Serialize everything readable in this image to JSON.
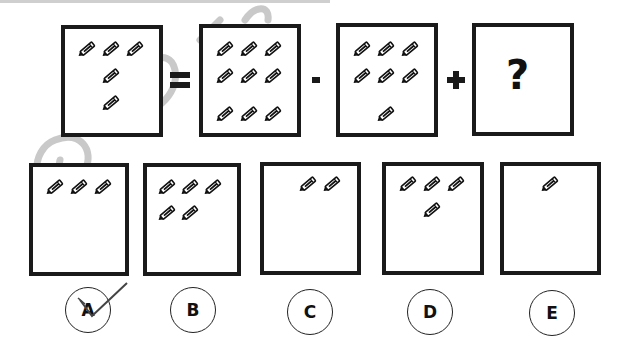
{
  "puzzle": {
    "equation": {
      "operators": [
        "=",
        "-",
        "+"
      ],
      "boxes": [
        {
          "id": "lhs",
          "pencil_count": 5
        },
        {
          "id": "minuend",
          "pencil_count": 9
        },
        {
          "id": "subtrahend",
          "pencil_count": 7
        },
        {
          "id": "unknown",
          "label": "?"
        }
      ]
    },
    "options": [
      {
        "label": "A",
        "pencil_count": 3,
        "marked_checked": true
      },
      {
        "label": "B",
        "pencil_count": 5,
        "marked_checked": false
      },
      {
        "label": "C",
        "pencil_count": 2,
        "marked_checked": false
      },
      {
        "label": "D",
        "pencil_count": 4,
        "marked_checked": false
      },
      {
        "label": "E",
        "pencil_count": 1,
        "marked_checked": false
      }
    ]
  },
  "icons": {
    "pencil": "pencil-icon",
    "checkmark": "checkmark-icon"
  },
  "colors": {
    "border": "#1a1a1a",
    "watermark": "#c8c8c8",
    "background": "#ffffff"
  }
}
